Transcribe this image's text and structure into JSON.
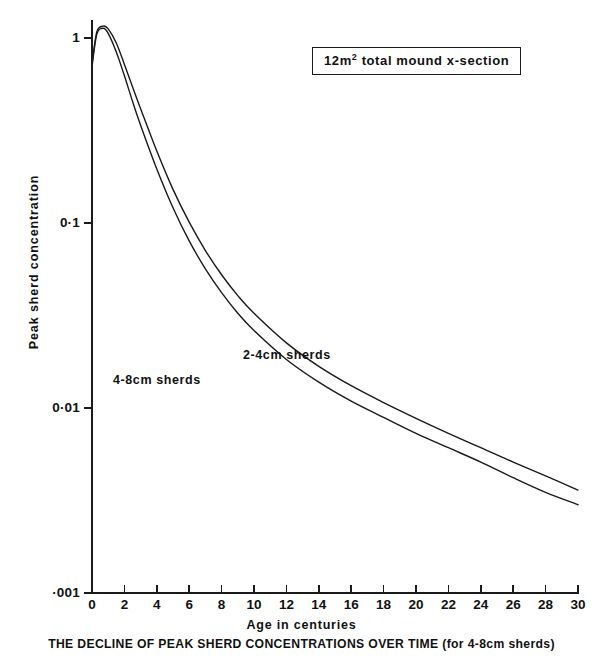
{
  "figure": {
    "caption": "THE DECLINE OF PEAK SHERD CONCENTRATIONS OVER TIME (for 4-8cm sherds)",
    "legend_box": {
      "prefix": "12m",
      "superscript": "2",
      "suffix": " total mound x-section",
      "full_text": "12m2 total mound x-section"
    }
  },
  "chart_data": {
    "type": "line",
    "title": "THE DECLINE OF PEAK SHERD CONCENTRATIONS OVER TIME (for 4-8cm sherds)",
    "annotation": "12m2 total mound x-section",
    "xlabel": "Age in centuries",
    "ylabel": "Peak sherd concentration",
    "yscale": "log",
    "xscale": "linear",
    "xlim": [
      0,
      30
    ],
    "ylim": [
      0.001,
      1.4
    ],
    "grid": false,
    "legend_position": "inline-labels",
    "xticks": [
      0,
      2,
      4,
      6,
      8,
      10,
      12,
      14,
      16,
      18,
      20,
      22,
      24,
      26,
      28,
      30
    ],
    "xticklabels": [
      "0",
      "2",
      "4",
      "6",
      "8",
      "10",
      "12",
      "14",
      "16",
      "18",
      "20",
      "22",
      "24",
      "26",
      "28",
      "30"
    ],
    "yticks": [
      1,
      0.1,
      0.01,
      0.001
    ],
    "yticklabels": [
      "1",
      "0·1",
      "0·01",
      "·001"
    ],
    "x": [
      0,
      0.3,
      0.7,
      1,
      1.5,
      2,
      2.5,
      3,
      4,
      5,
      6,
      7,
      8,
      9,
      10,
      12,
      14,
      16,
      18,
      20,
      22,
      24,
      26,
      28,
      30
    ],
    "series": [
      {
        "name": "2-4 cm sherds",
        "label": "2-4cm  sherds",
        "color": "#1a1a1a",
        "values": [
          0.72,
          1.08,
          1.16,
          1.12,
          0.94,
          0.72,
          0.545,
          0.415,
          0.245,
          0.152,
          0.101,
          0.071,
          0.0525,
          0.0405,
          0.0325,
          0.0225,
          0.0168,
          0.0132,
          0.0107,
          0.0088,
          0.0073,
          0.0061,
          0.0051,
          0.0043,
          0.0036
        ]
      },
      {
        "name": "4-8 cm sherds",
        "label": "4-8cm  sherds",
        "color": "#1a1a1a",
        "values": [
          0.7,
          1.05,
          1.13,
          1.06,
          0.84,
          0.625,
          0.455,
          0.338,
          0.196,
          0.121,
          0.08,
          0.0565,
          0.042,
          0.0325,
          0.0262,
          0.0183,
          0.0138,
          0.0109,
          0.0089,
          0.0073,
          0.0061,
          0.0051,
          0.0042,
          0.0035,
          0.003
        ]
      }
    ]
  }
}
